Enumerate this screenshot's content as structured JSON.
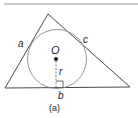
{
  "diagram": {
    "caption": "(a)",
    "labels": {
      "side_a": "a",
      "side_b": "b",
      "side_c": "c",
      "center": "O",
      "radius": "r"
    },
    "colors": {
      "stroke": "#4a4a4a",
      "circle": "#8a8a8a",
      "top_rule": "#9a9a9a",
      "text": "#222222"
    }
  }
}
